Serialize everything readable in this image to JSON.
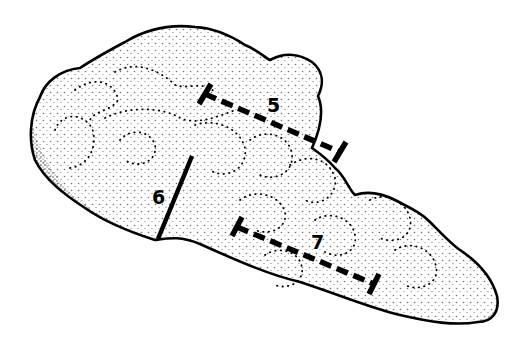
{
  "figure": {
    "colors": {
      "ink": "#000000",
      "background": "#ffffff"
    },
    "measurements": [
      {
        "label": "5",
        "style": "dashed-with-end-bars",
        "orientation": "diagonal, upper"
      },
      {
        "label": "6",
        "style": "solid",
        "orientation": "near-vertical, left"
      },
      {
        "label": "7",
        "style": "dashed-with-end-bars",
        "orientation": "diagonal, lower"
      }
    ]
  }
}
